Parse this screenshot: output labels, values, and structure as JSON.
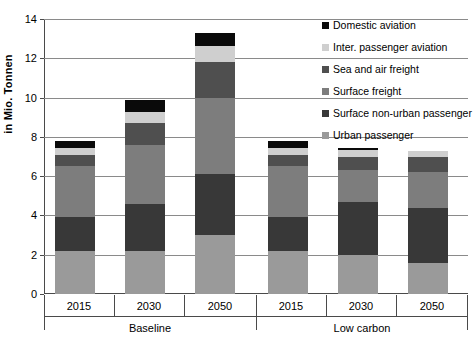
{
  "chart_data": {
    "type": "bar",
    "subtype": "stacked",
    "title": "",
    "xlabel": "",
    "ylabel": "in Mio. Tonnen",
    "ylim": [
      0,
      14
    ],
    "ytick_step": 2,
    "yticks": [
      "0",
      "2",
      "4",
      "6",
      "8",
      "10",
      "12",
      "14"
    ],
    "grid": true,
    "legend_position": "top-right",
    "categories": [
      "2015",
      "2030",
      "2050",
      "2015",
      "2030",
      "2050"
    ],
    "groups": [
      {
        "label": "Baseline",
        "categories": [
          "2015",
          "2030",
          "2050"
        ]
      },
      {
        "label": "Low carbon",
        "categories": [
          "2015",
          "2030",
          "2050"
        ]
      }
    ],
    "series": [
      {
        "name": "Urban passenger",
        "color": "#9a9a9a",
        "values": [
          2.2,
          2.2,
          3.0,
          2.2,
          2.0,
          1.6
        ]
      },
      {
        "name": "Surface non-urban passenger",
        "color": "#383838",
        "values": [
          1.7,
          2.4,
          3.1,
          1.7,
          2.7,
          2.8
        ]
      },
      {
        "name": "Surface freight",
        "color": "#7d7d7d",
        "values": [
          2.6,
          3.0,
          3.9,
          2.6,
          1.6,
          1.8
        ]
      },
      {
        "name": "Sea and air freight",
        "color": "#4f4f4f",
        "values": [
          0.6,
          1.1,
          1.8,
          0.6,
          0.7,
          0.8
        ]
      },
      {
        "name": "Inter. passenger aviation",
        "color": "#cfcfcf",
        "values": [
          0.35,
          0.55,
          0.85,
          0.35,
          0.35,
          0.3
        ]
      },
      {
        "name": "Domestic aviation",
        "color": "#0a0a0a",
        "values": [
          0.35,
          0.65,
          0.65,
          0.35,
          0.1,
          0.0
        ]
      }
    ],
    "totals": [
      7.8,
      9.9,
      13.35,
      7.8,
      7.45,
      7.3
    ]
  },
  "legend": {
    "items": [
      {
        "label": "Domestic aviation",
        "color": "#0a0a0a"
      },
      {
        "label": "Inter. passenger aviation",
        "color": "#cfcfcf"
      },
      {
        "label": "Sea and air freight",
        "color": "#4f4f4f"
      },
      {
        "label": "Surface freight",
        "color": "#7d7d7d"
      },
      {
        "label": "Surface non-urban passenger",
        "color": "#383838"
      },
      {
        "label": "Urban passenger",
        "color": "#9a9a9a"
      }
    ]
  }
}
